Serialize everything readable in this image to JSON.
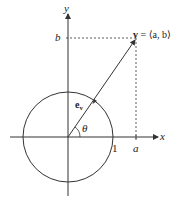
{
  "diagram": {
    "axes": {
      "x_label": "x",
      "y_label": "y"
    },
    "labels": {
      "b": "b",
      "a": "a",
      "one": "1",
      "theta": "θ",
      "unit_vector": "e",
      "unit_vector_sub": "v",
      "vector_bold": "v",
      "vector_eq": " = ⟨a, b⟩"
    },
    "geometry": {
      "origin": [
        68,
        137
      ],
      "unit_circle_radius": 45,
      "vector_tip": [
        136,
        38
      ]
    },
    "colors": {
      "stroke": "#333333",
      "background": "#ffffff"
    }
  }
}
